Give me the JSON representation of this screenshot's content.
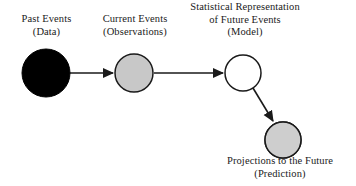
{
  "diagram": {
    "background_color": "#ffffff",
    "stroke_color": "#1a1a1a",
    "text_color": "#1a1a1a",
    "nodes": [
      {
        "id": "past-events",
        "label_line_1": "Past Events",
        "label_line_2": "(Data)",
        "fill_style": "solid-black",
        "fill_color": "#000000",
        "stroke_color": "#000000",
        "cx": 46,
        "cy": 73,
        "r": 24
      },
      {
        "id": "current-events",
        "label_line_1": "Current Events",
        "label_line_2": "(Observations)",
        "fill_style": "solid-gray",
        "fill_color": "#c8c8c8",
        "stroke_color": "#1a1a1a",
        "cx": 134,
        "cy": 73,
        "r": 19
      },
      {
        "id": "statistical-model",
        "label_line_1": "Statistical Representation",
        "label_line_2": "of Future Events",
        "label_line_3": "(Model)",
        "fill_style": "white",
        "fill_color": "#ffffff",
        "stroke_color": "#1a1a1a",
        "cx": 243,
        "cy": 73,
        "r": 18
      },
      {
        "id": "projections",
        "label_line_1": "Projections to the Future",
        "label_line_2": "(Prediction)",
        "fill_style": "speckled",
        "fill_color": "#d4d4d4",
        "speckle_color": "#555555",
        "stroke_color": "#1a1a1a",
        "cx": 283,
        "cy": 140,
        "r": 18
      }
    ],
    "arrows": [
      {
        "id": "past-to-current",
        "from": "past-events",
        "to": "current-events",
        "x1": 70,
        "y1": 73,
        "x2": 113,
        "y2": 73
      },
      {
        "id": "current-to-model",
        "from": "current-events",
        "to": "statistical-model",
        "x1": 154,
        "y1": 73,
        "x2": 223,
        "y2": 73
      },
      {
        "id": "model-to-projections",
        "from": "statistical-model",
        "to": "projections",
        "x1": 253,
        "y1": 88,
        "x2": 273,
        "y2": 121
      }
    ]
  }
}
